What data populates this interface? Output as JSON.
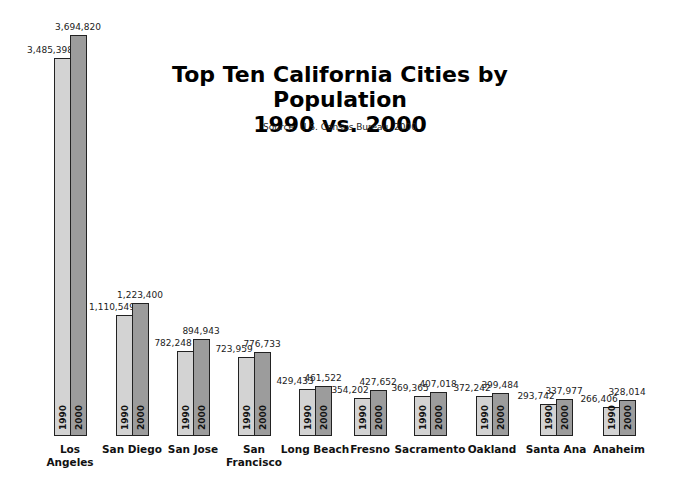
{
  "title_line1": "Top Ten California Cities by Population",
  "title_line2": "1990 vs. 2000",
  "source": "Source:  U.S. Census Bureau, 2000",
  "chart_data": {
    "type": "bar",
    "title": "Top Ten California Cities by Population 1990 vs. 2000",
    "subtitle": "Source: U.S. Census Bureau, 2000",
    "xlabel": "",
    "ylabel": "",
    "grid": false,
    "legend": "in-bar labels (1990, 2000)",
    "categories": [
      "Los Angeles",
      "San Diego",
      "San Jose",
      "San Francisco",
      "Long Beach",
      "Fresno",
      "Sacramento",
      "Oakland",
      "Santa Ana",
      "Anaheim"
    ],
    "category_labels": [
      [
        "Los",
        "Angeles"
      ],
      [
        "San Diego"
      ],
      [
        "San Jose"
      ],
      [
        "San",
        "Francisco"
      ],
      [
        "Long Beach"
      ],
      [
        "Fresno"
      ],
      [
        "Sacramento"
      ],
      [
        "Oakland"
      ],
      [
        "Santa Ana"
      ],
      [
        "Anaheim"
      ]
    ],
    "series": [
      {
        "name": "1990",
        "color": "#d3d3d3",
        "values": [
          3485398,
          1110549,
          782248,
          723959,
          429433,
          354202,
          369365,
          372242,
          293742,
          266406
        ],
        "labels": [
          "3,485,398",
          "1,110,549",
          "782,248",
          "723,959",
          "429,433",
          "354,202",
          "369,365",
          "372,242",
          "293,742",
          "266,406"
        ]
      },
      {
        "name": "2000",
        "color": "#9c9c9c",
        "values": [
          3694820,
          1223400,
          894943,
          776733,
          461522,
          427652,
          407018,
          399484,
          337977,
          328014
        ],
        "labels": [
          "3,694,820",
          "1,223,400",
          "894,943",
          "776,733",
          "461,522",
          "427,652",
          "407,018",
          "399,484",
          "337,977",
          "328,014"
        ]
      }
    ]
  }
}
